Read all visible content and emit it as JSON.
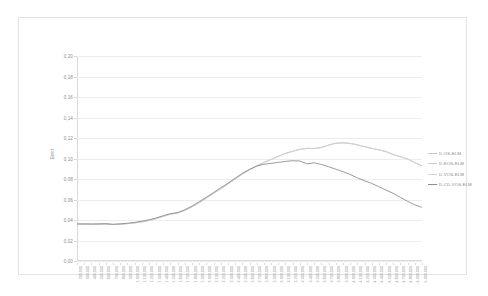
{
  "chart_data": {
    "type": "line",
    "title": "",
    "xlabel": "",
    "ylabel": "Error",
    "ylim": [
      0,
      0.2
    ],
    "ytick_step": 0.02,
    "ytick_labels": [
      "0,00",
      "0,02",
      "0,04",
      "0,06",
      "0,08",
      "0,10",
      "0,12",
      "0,14",
      "0,16",
      "0,18",
      "0,20"
    ],
    "grid": true,
    "legend_position": "right",
    "decimal_separator": ",",
    "thousands_separator": ".",
    "x": [
      200000,
      300000,
      400000,
      500000,
      600000,
      700000,
      800000,
      900000,
      1000000,
      1100000,
      1200000,
      1300000,
      1400000,
      1500000,
      1600000,
      1700000,
      1800000,
      1900000,
      2000000,
      2100000,
      2200000,
      2300000,
      2400000,
      2500000,
      2600000,
      2700000,
      2800000,
      2900000,
      3000000,
      3100000,
      3200000,
      3300000,
      3400000,
      3500000,
      3600000,
      3700000,
      3800000,
      3900000,
      4000000,
      4100000,
      4200000,
      4300000,
      4400000,
      4500000,
      4600000,
      4700000,
      4800000,
      4900000,
      5000000
    ],
    "categories": [
      "200.000",
      "300.000",
      "400.000",
      "500.000",
      "600.000",
      "700.000",
      "800.000",
      "900.000",
      "1.000.000",
      "1.100.000",
      "1.200.000",
      "1.300.000",
      "1.400.000",
      "1.500.000",
      "1.600.000",
      "1.700.000",
      "1.800.000",
      "1.900.000",
      "2.000.000",
      "2.100.000",
      "2.200.000",
      "2.300.000",
      "2.400.000",
      "2.500.000",
      "2.600.000",
      "2.700.000",
      "2.800.000",
      "2.900.000",
      "3.000.000",
      "3.100.000",
      "3.200.000",
      "3.300.000",
      "3.400.000",
      "3.500.000",
      "3.600.000",
      "3.700.000",
      "3.800.000",
      "3.900.000",
      "4.000.000",
      "4.100.000",
      "4.200.000",
      "4.300.000",
      "4.400.000",
      "4.500.000",
      "4.600.000",
      "4.700.000",
      "4.800.000",
      "4.900.000",
      "5.000.000"
    ],
    "series": [
      {
        "name": "D-OS-ELM",
        "color": "#c9c9c9",
        "width": 0.8,
        "values": [
          0.036,
          0.036,
          0.0359,
          0.036,
          0.0362,
          0.0357,
          0.036,
          0.0365,
          0.0372,
          0.0382,
          0.0396,
          0.0414,
          0.0436,
          0.0458,
          0.047,
          0.0496,
          0.053,
          0.057,
          0.0614,
          0.066,
          0.0706,
          0.0752,
          0.08,
          0.0848,
          0.089,
          0.0928,
          0.0962,
          0.0992,
          0.1022,
          0.105,
          0.1072,
          0.109,
          0.11,
          0.1098,
          0.1108,
          0.1132,
          0.115,
          0.1154,
          0.1148,
          0.1134,
          0.1116,
          0.11,
          0.1086,
          0.1068,
          0.104,
          0.1018,
          0.0996,
          0.096,
          0.093
        ]
      },
      {
        "name": "D-EOS-ELM",
        "color": "#cdcdcd",
        "width": 0.8,
        "values": [
          0.0359,
          0.0359,
          0.0358,
          0.0359,
          0.0361,
          0.0356,
          0.0359,
          0.0364,
          0.0371,
          0.0381,
          0.0395,
          0.0413,
          0.0435,
          0.0457,
          0.0469,
          0.0495,
          0.0529,
          0.0569,
          0.0613,
          0.0659,
          0.0705,
          0.0751,
          0.0799,
          0.0847,
          0.0889,
          0.0927,
          0.0961,
          0.0991,
          0.1021,
          0.1049,
          0.1071,
          0.1089,
          0.1099,
          0.1097,
          0.1107,
          0.1131,
          0.1149,
          0.1153,
          0.1147,
          0.1133,
          0.1115,
          0.1099,
          0.1085,
          0.1067,
          0.1039,
          0.1017,
          0.0995,
          0.0959,
          0.0929
        ]
      },
      {
        "name": "D-VOS-ELM",
        "color": "#d2d2d2",
        "width": 0.8,
        "values": [
          0.0358,
          0.0358,
          0.0357,
          0.0358,
          0.036,
          0.0355,
          0.0358,
          0.0363,
          0.037,
          0.038,
          0.0394,
          0.0412,
          0.0434,
          0.0456,
          0.0468,
          0.0494,
          0.0528,
          0.0568,
          0.0612,
          0.0658,
          0.0704,
          0.075,
          0.0798,
          0.0846,
          0.0888,
          0.0926,
          0.096,
          0.099,
          0.102,
          0.1048,
          0.107,
          0.1088,
          0.1098,
          0.1096,
          0.1106,
          0.113,
          0.1148,
          0.1152,
          0.1146,
          0.1132,
          0.1114,
          0.1098,
          0.1084,
          0.1066,
          0.1038,
          0.1016,
          0.0994,
          0.0958,
          0.0928
        ]
      },
      {
        "name": "D-CD-VOS-ELM",
        "color": "#8e8e8e",
        "width": 0.9,
        "values": [
          0.0362,
          0.0362,
          0.0361,
          0.0362,
          0.0364,
          0.0358,
          0.0362,
          0.0368,
          0.0376,
          0.0388,
          0.0402,
          0.042,
          0.0442,
          0.0462,
          0.0472,
          0.05,
          0.0536,
          0.0578,
          0.0622,
          0.0668,
          0.0714,
          0.076,
          0.0808,
          0.0856,
          0.0894,
          0.0926,
          0.0944,
          0.0952,
          0.0962,
          0.0972,
          0.0978,
          0.0976,
          0.0948,
          0.0958,
          0.0942,
          0.092,
          0.0896,
          0.0872,
          0.0844,
          0.0812,
          0.0782,
          0.0758,
          0.0724,
          0.0692,
          0.066,
          0.062,
          0.0582,
          0.0548,
          0.0524
        ]
      }
    ]
  }
}
